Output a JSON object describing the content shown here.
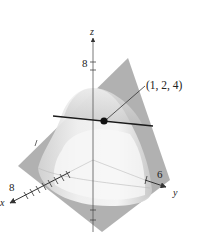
{
  "figure": {
    "type": "3d-surface-plot",
    "axes": {
      "z": {
        "label": "z",
        "tick_label": "8"
      },
      "x": {
        "label": "x",
        "tick_label": "8"
      },
      "y": {
        "label": "y",
        "tick_label": "6"
      }
    },
    "point": {
      "label": "(1, 2, 4)",
      "color": "#111111"
    },
    "colors": {
      "plane": "#9a9a9a",
      "surface_light": "#f2f2f2",
      "surface_shade": "#cfcfcf",
      "axis": "#333333",
      "tangent_line": "#1a1a1a"
    }
  }
}
